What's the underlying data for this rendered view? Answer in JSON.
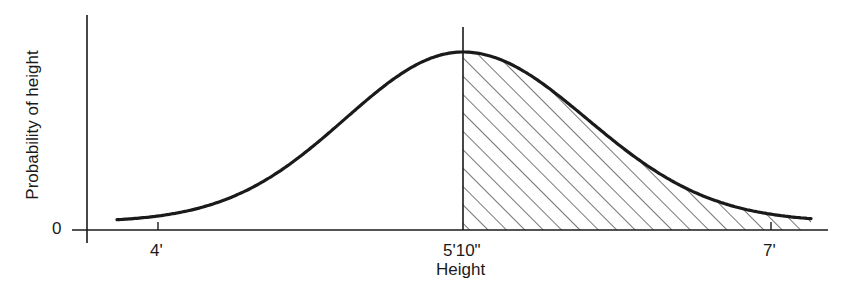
{
  "chart_data": {
    "type": "line",
    "title": "",
    "xlabel": "Height",
    "ylabel": "Probability of height",
    "x_tick_labels": [
      "4'",
      "5'10\"",
      "7'"
    ],
    "y_tick_labels": [
      "0"
    ],
    "distribution": "normal",
    "mean_label": "5'10\"",
    "shaded_region": "area under curve to the right of 5'10\" (heights above mean), hatched",
    "series": [
      {
        "name": "Probability density of height",
        "x_inches": [
          46,
          48,
          52,
          56,
          60,
          64,
          68,
          70,
          72,
          76,
          80,
          84,
          88,
          92
        ],
        "relative_density": [
          0.01,
          0.03,
          0.08,
          0.2,
          0.38,
          0.65,
          0.93,
          1.0,
          0.96,
          0.72,
          0.45,
          0.22,
          0.09,
          0.02
        ]
      }
    ],
    "grid": false,
    "legend": null
  },
  "axes": {
    "ylabel": "Probability of height",
    "xlabel": "Height",
    "y_zero": "0",
    "ticks": [
      {
        "label": "4'"
      },
      {
        "label": "5'10\""
      },
      {
        "label": "7'"
      }
    ]
  },
  "colors": {
    "ink": "#1a1a1a",
    "background": "#ffffff"
  }
}
